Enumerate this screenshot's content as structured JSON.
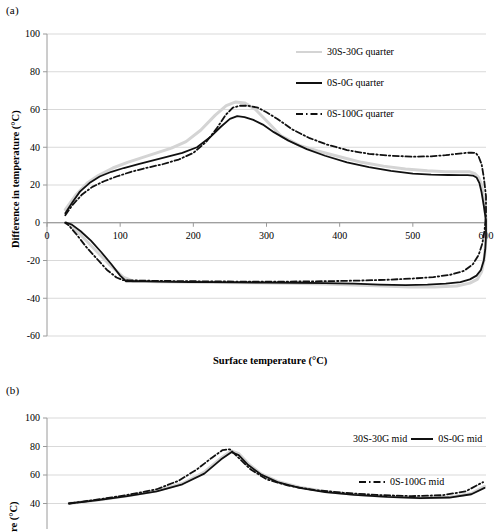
{
  "figure": {
    "panels": [
      {
        "tag": "(a)",
        "legend": [
          {
            "label": "30S-30G quarter",
            "style": "grey-solid",
            "color": "#d4d4d4"
          },
          {
            "label": "0S-0G quarter",
            "style": "black-solid",
            "color": "#111111"
          },
          {
            "label": "0S-100G quarter",
            "style": "black-dashdot",
            "color": "#111111"
          }
        ]
      },
      {
        "tag": "(b)",
        "legend": [
          {
            "label": "30S-30G mid",
            "style": "grey-solid",
            "color": "#d4d4d4"
          },
          {
            "label": "0S-0G mid",
            "style": "black-solid",
            "color": "#111111"
          },
          {
            "label": "0S-100G mid",
            "style": "black-dashdot",
            "color": "#111111"
          }
        ]
      }
    ]
  },
  "chart_data": [
    {
      "type": "line",
      "panel": "(a)",
      "title": "",
      "xlabel": "Surface temperature  (°C)",
      "ylabel": "Difference in temperature (°C)",
      "xlim": [
        0,
        600
      ],
      "ylim": [
        -60,
        100
      ],
      "xticks": [
        0,
        100,
        200,
        300,
        400,
        500,
        600
      ],
      "yticks": [
        -60,
        -40,
        -20,
        0,
        20,
        40,
        60,
        80,
        100
      ],
      "grid": "horizontal",
      "legend_position": "top-right",
      "series": [
        {
          "name": "30S-30G quarter",
          "color": "#d4d4d4",
          "linestyle": "solid",
          "x": [
            25,
            40,
            55,
            70,
            90,
            110,
            130,
            150,
            170,
            190,
            210,
            230,
            245,
            258,
            270,
            285,
            300,
            320,
            345,
            370,
            400,
            430,
            460,
            490,
            520,
            545,
            565,
            578,
            585,
            590,
            594,
            597,
            600,
            600,
            598,
            594,
            588,
            578,
            560,
            530,
            495,
            460,
            420,
            380,
            330,
            280,
            230,
            185,
            150,
            130,
            118,
            105,
            85,
            65,
            45,
            30,
            25
          ],
          "y": [
            7,
            15,
            21,
            25,
            29,
            32,
            34.5,
            37,
            39.5,
            43,
            49,
            57,
            62,
            64,
            63.5,
            60,
            54,
            46,
            41,
            38,
            35,
            32,
            30,
            28.5,
            27.5,
            27,
            27,
            27,
            26,
            24,
            20,
            12,
            2,
            -8,
            -18,
            -26,
            -30,
            -32,
            -33.5,
            -34,
            -34,
            -33.5,
            -33,
            -32.5,
            -32,
            -31.8,
            -31.6,
            -31.4,
            -31.2,
            -31,
            -31,
            -29,
            -22,
            -14,
            -6,
            -1,
            0
          ]
        },
        {
          "name": "0S-0G quarter",
          "color": "#111111",
          "linestyle": "solid",
          "x": [
            25,
            35,
            45,
            58,
            72,
            88,
            105,
            125,
            145,
            165,
            185,
            205,
            222,
            238,
            250,
            260,
            270,
            282,
            295,
            310,
            330,
            355,
            380,
            410,
            440,
            470,
            500,
            525,
            548,
            565,
            575,
            582,
            587,
            591,
            594,
            597,
            600,
            600,
            599,
            597,
            593,
            587,
            578,
            565,
            545,
            520,
            490,
            455,
            420,
            380,
            340,
            300,
            260,
            225,
            195,
            170,
            150,
            135,
            122,
            113,
            108,
            100,
            88,
            74,
            60,
            46,
            34,
            27,
            25
          ],
          "y": [
            5,
            11,
            16.5,
            21,
            24.5,
            27,
            29,
            31,
            33,
            35,
            37,
            40,
            45,
            51,
            55,
            56.5,
            56,
            54.5,
            52,
            48,
            43.5,
            39,
            35.5,
            32,
            29.5,
            27.5,
            26,
            25.5,
            25.3,
            25.2,
            25.2,
            25,
            24,
            21,
            16,
            9,
            1,
            -7,
            -14,
            -20,
            -25,
            -28,
            -30,
            -31.5,
            -32.3,
            -32.8,
            -33,
            -32.8,
            -32.3,
            -32,
            -31.8,
            -31.7,
            -31.6,
            -31.5,
            -31.4,
            -31.3,
            -31.2,
            -31.1,
            -31,
            -31,
            -31,
            -28,
            -22,
            -15.5,
            -9.5,
            -4.5,
            -1,
            0,
            0
          ]
        },
        {
          "name": "0S-100G quarter",
          "color": "#111111",
          "linestyle": "dashdot",
          "x": [
            25,
            35,
            48,
            62,
            78,
            95,
            115,
            135,
            158,
            180,
            200,
            218,
            232,
            244,
            254,
            264,
            275,
            288,
            300,
            315,
            335,
            358,
            382,
            410,
            440,
            470,
            500,
            525,
            545,
            560,
            572,
            580,
            586,
            590,
            594,
            597,
            600,
            600,
            598,
            595,
            590,
            582,
            570,
            552,
            528,
            498,
            465,
            430,
            392,
            352,
            312,
            272,
            235,
            202,
            175,
            152,
            135,
            122,
            112,
            104,
            95,
            82,
            68,
            54,
            40,
            30,
            25
          ],
          "y": [
            4,
            9.5,
            15,
            19,
            22,
            24.5,
            27,
            29,
            31,
            33.5,
            37,
            43,
            50,
            57,
            61,
            62,
            62,
            61,
            58.5,
            55,
            49.5,
            45,
            41.5,
            38.5,
            36.5,
            35.5,
            35,
            35.2,
            35.8,
            36.5,
            37,
            37.2,
            37,
            35,
            31,
            24,
            14,
            4,
            -4,
            -11,
            -17,
            -22,
            -25.5,
            -27.5,
            -28.8,
            -29.6,
            -30.2,
            -30.6,
            -30.9,
            -31.1,
            -31.2,
            -31.2,
            -31.1,
            -31,
            -30.9,
            -30.8,
            -30.7,
            -30.6,
            -30.5,
            -30.4,
            -29,
            -25,
            -19,
            -13,
            -6,
            -1.5,
            0
          ]
        }
      ]
    },
    {
      "type": "line",
      "panel": "(b)",
      "title": "",
      "xlabel": "",
      "ylabel": "re (°C)",
      "xlim": [
        0,
        600
      ],
      "ylim": [
        40,
        100
      ],
      "yticks": [
        40,
        60,
        80,
        100
      ],
      "grid": "horizontal",
      "legend_position": "top-right",
      "series": [
        {
          "name": "30S-30G mid",
          "color": "#d4d4d4",
          "linestyle": "solid",
          "x": [
            30,
            70,
            110,
            150,
            185,
            215,
            238,
            252,
            262,
            275,
            292,
            315,
            345,
            380,
            420,
            465,
            510,
            550,
            580,
            598
          ],
          "y": [
            40,
            42.5,
            45.5,
            49,
            54,
            62,
            72,
            77,
            75,
            68,
            61,
            55.5,
            51.5,
            48.5,
            46.5,
            45,
            44,
            44.5,
            47,
            52
          ]
        },
        {
          "name": "0S-0G mid",
          "color": "#111111",
          "linestyle": "solid",
          "x": [
            30,
            70,
            110,
            150,
            185,
            215,
            238,
            252,
            262,
            275,
            292,
            315,
            345,
            380,
            420,
            465,
            510,
            550,
            580,
            598
          ],
          "y": [
            40,
            42.3,
            45.2,
            48.5,
            53.5,
            61,
            71,
            76,
            74,
            67,
            60.5,
            55,
            51,
            48,
            46,
            44.6,
            43.8,
            44.2,
            46.5,
            51
          ]
        },
        {
          "name": "0S-100G mid",
          "color": "#111111",
          "linestyle": "dashdot",
          "x": [
            30,
            70,
            110,
            150,
            180,
            205,
            225,
            240,
            250,
            262,
            278,
            300,
            330,
            365,
            405,
            450,
            498,
            540,
            572,
            596
          ],
          "y": [
            40,
            42.8,
            46,
            50,
            56,
            64,
            72,
            77.5,
            78,
            72,
            64,
            57,
            52.5,
            49.5,
            47.5,
            46,
            45.2,
            45.8,
            48.5,
            55
          ]
        }
      ]
    }
  ]
}
